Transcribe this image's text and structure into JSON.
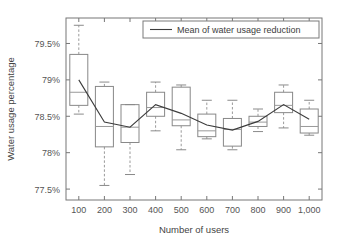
{
  "chart_data": {
    "type": "box",
    "title": "",
    "xlabel": "Number of users",
    "ylabel": "Water usage percentage",
    "categories": [
      "100",
      "200",
      "300",
      "400",
      "500",
      "600",
      "700",
      "800",
      "900",
      "1,000"
    ],
    "ylim": [
      77.35,
      79.85
    ],
    "yticks": [
      77.5,
      78.0,
      78.5,
      79.0,
      79.5
    ],
    "ytick_labels": [
      "77.5%",
      "78%",
      "78.5%",
      "79%",
      "79.5%"
    ],
    "grid": false,
    "legend": {
      "position": "top-right",
      "entries": [
        {
          "label": "Mean of water usage reduction",
          "marker": "line",
          "color": "#3c3c3c"
        }
      ]
    },
    "boxes": [
      {
        "category": "100",
        "whisker_low": 78.53,
        "q1": 78.65,
        "median": 78.83,
        "q3": 79.35,
        "whisker_high": 79.75
      },
      {
        "category": "200",
        "whisker_low": 77.55,
        "q1": 78.08,
        "median": 78.36,
        "q3": 78.91,
        "whisker_high": 78.97
      },
      {
        "category": "300",
        "whisker_low": 77.7,
        "q1": 78.14,
        "median": 78.35,
        "q3": 78.66,
        "whisker_high": 78.66
      },
      {
        "category": "400",
        "whisker_low": 78.3,
        "q1": 78.5,
        "median": 78.62,
        "q3": 78.83,
        "whisker_high": 78.97
      },
      {
        "category": "500",
        "whisker_low": 78.04,
        "q1": 78.37,
        "median": 78.45,
        "q3": 78.9,
        "whisker_high": 78.93
      },
      {
        "category": "600",
        "whisker_low": 78.19,
        "q1": 78.22,
        "median": 78.3,
        "q3": 78.53,
        "whisker_high": 78.72
      },
      {
        "category": "700",
        "whisker_low": 78.04,
        "q1": 78.09,
        "median": 78.32,
        "q3": 78.47,
        "whisker_high": 78.72
      },
      {
        "category": "800",
        "whisker_low": 78.29,
        "q1": 78.36,
        "median": 78.42,
        "q3": 78.5,
        "whisker_high": 78.6
      },
      {
        "category": "900",
        "whisker_low": 78.34,
        "q1": 78.55,
        "median": 78.65,
        "q3": 78.83,
        "whisker_high": 78.93
      },
      {
        "category": "1,000",
        "whisker_low": 78.24,
        "q1": 78.27,
        "median": 78.36,
        "q3": 78.6,
        "whisker_high": 78.72
      }
    ],
    "series": [
      {
        "name": "Mean of water usage reduction",
        "values": [
          79.0,
          78.42,
          78.35,
          78.66,
          78.54,
          78.38,
          78.31,
          78.43,
          78.66,
          78.46
        ]
      }
    ]
  }
}
